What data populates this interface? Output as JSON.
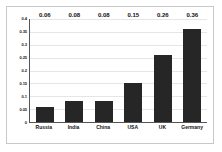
{
  "chart_data": {
    "type": "bar",
    "title": "",
    "subtitle": "",
    "xlabel": "",
    "ylabel": "",
    "categories": [
      "Russia",
      "India",
      "China",
      "USA",
      "UK",
      "Germany"
    ],
    "values": [
      0.06,
      0.08,
      0.08,
      0.15,
      0.26,
      0.36
    ],
    "data_labels": [
      "0.06",
      "0.08",
      "0.08",
      "0.15",
      "0.26",
      "0.36"
    ],
    "ylim": [
      0,
      0.4
    ],
    "ytick_labels": [
      "0",
      "0.05",
      "0.1",
      "0.15",
      "0.2",
      "0.25",
      "0.3",
      "0.35",
      "0.4"
    ],
    "ytick_values": [
      0,
      0.05,
      0.1,
      0.15,
      0.2,
      0.25,
      0.3,
      0.35,
      0.4
    ],
    "grid": true,
    "legend": false,
    "legend_position": "none",
    "colors": {
      "bar": "#262626",
      "grid": "#e6e6e6",
      "axis": "#555555",
      "frame": "#c8c8c8",
      "background": "#ffffff",
      "label_text": "#111111"
    }
  }
}
